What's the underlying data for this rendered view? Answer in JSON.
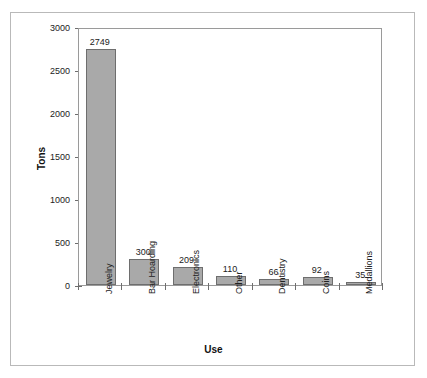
{
  "chart_data": {
    "type": "bar",
    "title": "",
    "xlabel": "Use",
    "ylabel": "Tons",
    "categories": [
      "Jewelry",
      "Bar Hoarding",
      "Electronics",
      "Other",
      "Dentistry",
      "Coins",
      "Medallions"
    ],
    "values": [
      2749,
      300,
      209,
      110,
      66,
      92,
      35
    ],
    "value_labels": [
      "2749",
      "300",
      "209",
      "110",
      "66",
      "92",
      "35"
    ],
    "ylim": [
      0,
      3000
    ],
    "yticks": [
      0,
      500,
      1000,
      1500,
      2000,
      2500,
      3000
    ],
    "ytick_labels": [
      "0",
      "500",
      "1000",
      "1500",
      "2000",
      "2500",
      "3000"
    ],
    "grid": false,
    "legend": null,
    "bar_color": "#a9a9a9",
    "bar_border_color": "#6e6e6e",
    "axis_color": "#9a9a9a",
    "frame_color": "#b9b9b9",
    "background": "#ffffff"
  }
}
